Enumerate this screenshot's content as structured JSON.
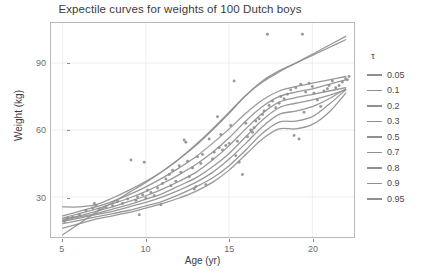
{
  "chart_data": {
    "type": "line",
    "title": "Expectile curves for weights of 100 Dutch boys",
    "xlabel": "Age (yr)",
    "ylabel": "Weight (kg)",
    "xlim": [
      4.3,
      22.5
    ],
    "ylim": [
      12,
      108
    ],
    "xticks": [
      5,
      10,
      15,
      20
    ],
    "yticks": [
      30,
      60,
      90
    ],
    "grid": true,
    "legend_position": "right",
    "legend_title": "τ",
    "line_color": "#8f8f8f",
    "point_color": "#9a9a9a",
    "panel_background": "#ffffff",
    "grid_color": "#ececec",
    "series": [
      {
        "name": "0.05",
        "tau": 0.05,
        "x": [
          5,
          6,
          7,
          8,
          9,
          10,
          11,
          12,
          13,
          14,
          15,
          16,
          17,
          18,
          19,
          20,
          21,
          22
        ],
        "values": [
          16.0,
          18.0,
          20.0,
          21.5,
          23.0,
          25.0,
          27.0,
          29.5,
          32.5,
          36.5,
          42.0,
          49.0,
          56.0,
          60.5,
          60.5,
          62.5,
          68.0,
          76.5
        ]
      },
      {
        "name": "0.1",
        "tau": 0.1,
        "x": [
          5,
          6,
          7,
          8,
          9,
          10,
          11,
          12,
          13,
          14,
          15,
          16,
          17,
          18,
          19,
          20,
          21,
          22
        ],
        "values": [
          18.0,
          19.5,
          21.0,
          22.5,
          24.0,
          26.0,
          28.0,
          31.0,
          34.5,
          38.5,
          44.0,
          51.0,
          58.5,
          63.5,
          64.0,
          66.0,
          71.5,
          78.0
        ]
      },
      {
        "name": "0.2",
        "tau": 0.2,
        "x": [
          5,
          6,
          7,
          8,
          9,
          10,
          11,
          12,
          13,
          14,
          15,
          16,
          17,
          18,
          19,
          20,
          21,
          22
        ],
        "values": [
          19.0,
          20.5,
          22.0,
          23.5,
          25.5,
          27.5,
          30.0,
          33.0,
          36.5,
          41.0,
          47.0,
          54.0,
          61.5,
          67.0,
          68.5,
          70.5,
          74.0,
          78.5
        ]
      },
      {
        "name": "0.3",
        "tau": 0.3,
        "x": [
          5,
          6,
          7,
          8,
          9,
          10,
          11,
          12,
          13,
          14,
          15,
          16,
          17,
          18,
          19,
          20,
          21,
          22
        ],
        "values": [
          19.5,
          21.0,
          22.5,
          24.5,
          26.5,
          29.0,
          31.5,
          35.0,
          38.5,
          43.5,
          49.5,
          57.0,
          64.5,
          70.0,
          72.0,
          73.5,
          75.5,
          78.0
        ]
      },
      {
        "name": "0.5",
        "tau": 0.5,
        "x": [
          5,
          6,
          7,
          8,
          9,
          10,
          11,
          12,
          13,
          14,
          15,
          16,
          17,
          18,
          19,
          20,
          21,
          22
        ],
        "values": [
          20.0,
          21.5,
          23.5,
          25.5,
          28.0,
          30.5,
          33.5,
          37.0,
          41.0,
          46.5,
          53.0,
          60.5,
          67.5,
          72.5,
          74.5,
          76.0,
          77.5,
          79.0
        ]
      },
      {
        "name": "0.7",
        "tau": 0.7,
        "x": [
          5,
          6,
          7,
          8,
          9,
          10,
          11,
          12,
          13,
          14,
          15,
          16,
          17,
          18,
          19,
          20,
          21,
          22
        ],
        "values": [
          20.5,
          22.5,
          24.5,
          27.0,
          29.5,
          32.5,
          36.0,
          40.0,
          44.5,
          50.0,
          56.5,
          64.0,
          70.5,
          75.0,
          77.0,
          78.5,
          80.5,
          82.5
        ]
      },
      {
        "name": "0.8",
        "tau": 0.8,
        "x": [
          5,
          6,
          7,
          8,
          9,
          10,
          11,
          12,
          13,
          14,
          15,
          16,
          17,
          18,
          19,
          20,
          21,
          22
        ],
        "values": [
          21.5,
          23.5,
          25.5,
          28.0,
          31.0,
          34.5,
          38.5,
          43.0,
          48.0,
          54.0,
          60.5,
          67.5,
          73.5,
          77.5,
          79.5,
          81.0,
          82.5,
          84.0
        ]
      },
      {
        "name": "0.9",
        "tau": 0.9,
        "x": [
          5,
          6,
          7,
          8,
          9,
          10,
          11,
          12,
          13,
          14,
          15,
          16,
          17,
          18,
          19,
          20,
          21,
          22
        ],
        "values": [
          25.5,
          25.5,
          26.5,
          29.5,
          33.0,
          37.0,
          41.5,
          47.0,
          53.0,
          60.0,
          67.5,
          75.5,
          82.0,
          86.5,
          90.0,
          93.5,
          97.0,
          100.5
        ]
      },
      {
        "name": "0.95",
        "tau": 0.95,
        "x": [
          5,
          6,
          7,
          8,
          9,
          10,
          11,
          12,
          13,
          14,
          15,
          16,
          17,
          18,
          19,
          20,
          21,
          22
        ],
        "values": [
          13.0,
          18.0,
          23.0,
          27.5,
          32.0,
          36.5,
          41.5,
          47.0,
          53.5,
          60.5,
          68.0,
          75.5,
          81.5,
          86.0,
          90.0,
          94.0,
          98.0,
          102.0
        ]
      }
    ],
    "scatter": {
      "label": "100 Dutch boys",
      "x": [
        5.1,
        5.3,
        5.6,
        6.0,
        6.4,
        6.8,
        6.9,
        7.0,
        7.2,
        7.6,
        8.0,
        8.3,
        8.6,
        8.9,
        9.1,
        9.4,
        9.5,
        9.6,
        9.8,
        9.9,
        10.0,
        10.1,
        10.3,
        10.5,
        10.7,
        10.9,
        11.0,
        11.2,
        11.4,
        11.5,
        11.6,
        11.8,
        12.0,
        12.1,
        12.3,
        12.4,
        12.5,
        12.6,
        12.8,
        12.9,
        13.0,
        13.1,
        13.3,
        13.4,
        13.6,
        13.8,
        14.0,
        14.1,
        14.3,
        14.4,
        14.5,
        14.6,
        14.8,
        15.0,
        15.1,
        15.3,
        15.4,
        15.5,
        15.6,
        15.8,
        16.0,
        16.1,
        16.3,
        16.4,
        16.5,
        16.6,
        16.8,
        17.0,
        17.1,
        17.3,
        17.4,
        17.6,
        17.8,
        18.0,
        18.1,
        18.3,
        18.5,
        18.7,
        18.9,
        19.0,
        19.2,
        19.3,
        19.4,
        19.5,
        19.6,
        19.8,
        20.0,
        20.1,
        20.3,
        20.5,
        20.7,
        20.9,
        21.0,
        21.2,
        21.4,
        21.6,
        21.8,
        22.0,
        22.1,
        22.2
      ],
      "y": [
        19.0,
        20.5,
        21.0,
        22.0,
        24.0,
        25.0,
        27.0,
        26.0,
        24.5,
        25.5,
        26.0,
        28.0,
        27.0,
        29.0,
        46.5,
        28.5,
        30.0,
        22.0,
        31.0,
        45.5,
        29.5,
        33.0,
        32.0,
        30.5,
        34.0,
        26.5,
        36.0,
        38.0,
        40.0,
        35.0,
        42.0,
        37.0,
        44.0,
        41.0,
        55.5,
        54.5,
        46.0,
        39.0,
        43.0,
        33.5,
        34.5,
        48.0,
        45.0,
        49.0,
        35.5,
        56.0,
        47.0,
        50.0,
        66.0,
        52.0,
        58.0,
        51.0,
        53.0,
        54.0,
        62.0,
        82.0,
        48.5,
        55.0,
        45.5,
        40.0,
        63.0,
        57.0,
        60.0,
        59.0,
        61.0,
        64.0,
        65.0,
        67.0,
        68.5,
        103.0,
        71.0,
        73.0,
        70.0,
        72.0,
        75.0,
        74.0,
        76.0,
        78.0,
        57.5,
        79.0,
        56.0,
        80.5,
        103.0,
        68.0,
        77.0,
        81.0,
        79.5,
        76.5,
        73.5,
        70.5,
        77.5,
        78.5,
        80.0,
        82.0,
        79.0,
        80.0,
        81.5,
        83.0,
        82.5,
        84.0
      ]
    }
  },
  "legend": {
    "title": "τ",
    "items": [
      {
        "label": "0.05"
      },
      {
        "label": "0.1"
      },
      {
        "label": "0.2"
      },
      {
        "label": "0.3"
      },
      {
        "label": "0.5"
      },
      {
        "label": "0.7"
      },
      {
        "label": "0.8"
      },
      {
        "label": "0.9"
      },
      {
        "label": "0.95"
      }
    ]
  }
}
